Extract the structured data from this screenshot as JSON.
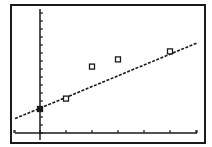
{
  "screen": {
    "type": "graphing-calculator-plot",
    "background": "#ffffff",
    "ink": "#1a1a1a"
  },
  "chart_data": {
    "type": "scatter",
    "title": "",
    "xlabel": "",
    "ylabel": "",
    "xlim": [
      -1,
      6
    ],
    "ylim": [
      0,
      15.5
    ],
    "x_tick_step": 1,
    "y_tick_step": 1,
    "grid": false,
    "legend": null,
    "series": [
      {
        "name": "data",
        "marker": "open-square",
        "points": [
          {
            "x": 0,
            "y": 3.0
          },
          {
            "x": 1,
            "y": 4.3
          },
          {
            "x": 2,
            "y": 8.3
          },
          {
            "x": 3,
            "y": 9.2
          },
          {
            "x": 5,
            "y": 10.2
          }
        ]
      },
      {
        "name": "regression line",
        "style": "dashed",
        "line": {
          "slope": 1.35,
          "intercept": 3.1,
          "x_start": -1,
          "x_end": 6.2
        }
      }
    ]
  },
  "frame": {
    "left": 11,
    "top": 5,
    "right": 205,
    "bottom": 143
  },
  "plot_px": {
    "x0": 40,
    "y0": 133,
    "px_per_x": 26,
    "px_per_y": 8,
    "x_left": 15,
    "x_right": 197,
    "y_top": 9
  }
}
